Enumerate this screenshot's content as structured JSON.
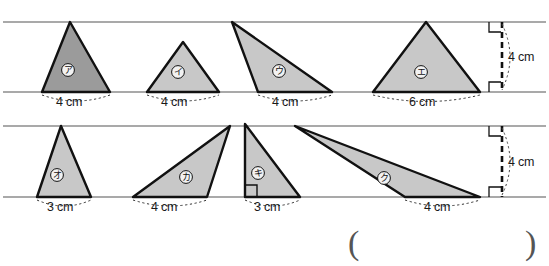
{
  "worksheet": {
    "title": "triangle-base-height-worksheet",
    "answer_bracket": {
      "open": "(",
      "close": ")"
    }
  },
  "rows": [
    {
      "row_name": "top-row",
      "guide_top_y": 22,
      "guide_bottom_y": 92,
      "height_label": "4 cm",
      "triangles": [
        {
          "id": "tri-a",
          "label": "ア",
          "base_label": "4 cm",
          "fill": "#9b9b9b",
          "points": "70,22 110,92 42,92",
          "label_x": 68,
          "label_y": 70,
          "dim_x": 56,
          "dim_y": 101,
          "arc": "M 42,95 Q 76,107 110,95"
        },
        {
          "id": "tri-i",
          "label": "イ",
          "base_label": "4 cm",
          "fill": "#c8c8c8",
          "points": "183,42 219,92 147,92",
          "label_x": 178,
          "label_y": 72,
          "dim_x": 161,
          "dim_y": 101,
          "arc": "M 147,95 Q 183,107 219,95"
        },
        {
          "id": "tri-u",
          "label": "ウ",
          "base_label": "4 cm",
          "fill": "#c8c8c8",
          "points": "232,22 332,92 258,92",
          "label_x": 279,
          "label_y": 71,
          "dim_x": 272,
          "dim_y": 101,
          "arc": "M 258,95 Q 295,107 332,95"
        },
        {
          "id": "tri-e",
          "label": "エ",
          "base_label": "6 cm",
          "fill": "#c8c8c8",
          "points": "426,22 480,92 373,92",
          "label_x": 421,
          "label_y": 72,
          "dim_x": 409,
          "dim_y": 101,
          "arc": "M 373,95 Q 427,108 480,95"
        }
      ],
      "height_marker": {
        "x": 502,
        "top_y": 22,
        "bottom_y": 92,
        "label_x": 508,
        "label_y": 57,
        "arc": "M 502,24 Q 518,57 502,90"
      }
    },
    {
      "row_name": "bottom-row",
      "guide_top_y": 126,
      "guide_bottom_y": 197,
      "height_label": "4 cm",
      "triangles": [
        {
          "id": "tri-o",
          "label": "オ",
          "base_label": "3 cm",
          "fill": "#c8c8c8",
          "points": "61,126 91,197 37,197",
          "label_x": 57,
          "label_y": 175,
          "dim_x": 47,
          "dim_y": 206,
          "arc": "M 37,200 Q 64,212 91,200"
        },
        {
          "id": "tri-ka",
          "label": "カ",
          "base_label": "4 cm",
          "fill": "#c8c8c8",
          "points": "230,126 207,197 133,197",
          "label_x": 186,
          "label_y": 177,
          "dim_x": 151,
          "dim_y": 206,
          "arc": "M 133,200 Q 170,212 207,200"
        },
        {
          "id": "tri-ki",
          "label": "キ",
          "base_label": "3 cm",
          "fill": "#c8c8c8",
          "points": "245,124 300,197 245,197",
          "label_x": 258,
          "label_y": 173,
          "dim_x": 254,
          "dim_y": 206,
          "arc": "M 245,200 Q 272,212 300,200"
        },
        {
          "id": "tri-ku",
          "label": "ク",
          "base_label": "4 cm",
          "fill": "#c8c8c8",
          "points": "295,126 480,197 405,197",
          "label_x": 384,
          "label_y": 178,
          "dim_x": 424,
          "dim_y": 206,
          "arc": "M 405,200 Q 442,212 480,200"
        }
      ],
      "height_marker": {
        "x": 502,
        "top_y": 126,
        "bottom_y": 197,
        "label_x": 508,
        "label_y": 162,
        "arc": "M 502,128 Q 518,162 502,195"
      }
    }
  ],
  "colors": {
    "guide_line": "#8d8d8d",
    "outline": "#111111",
    "fill_dark": "#9b9b9b",
    "fill_light": "#c8c8c8",
    "text": "#1a1a1a",
    "bracket": "#555555"
  }
}
